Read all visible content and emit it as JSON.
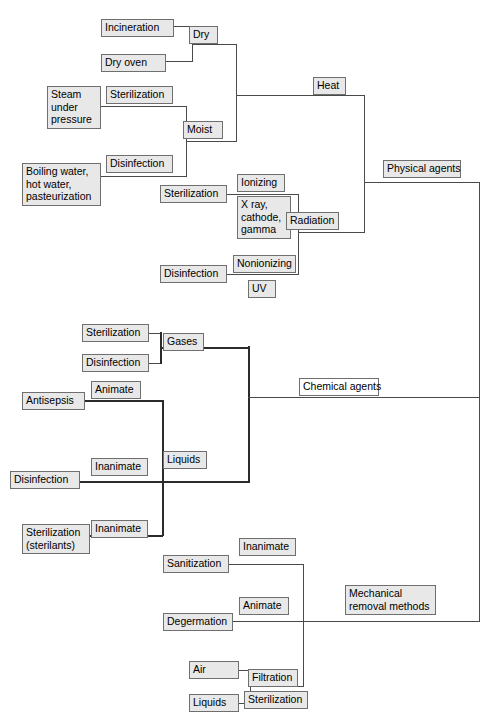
{
  "diagram": {
    "type": "hierarchy-tree",
    "colors": {
      "node_fill": "#e8e8e8",
      "node_fill_plain": "#ffffff",
      "node_border": "#6f6f6f",
      "connector": "#4a4a4a",
      "connector_thick": "#2b2b2b"
    },
    "nodes": {
      "incineration": "Incineration",
      "dry_oven": "Dry oven",
      "dry": "Dry",
      "sterilization_moist": "Sterilization",
      "steam_under_pressure": "Steam\nunder\npressure",
      "moist": "Moist",
      "heat": "Heat",
      "disinfection_moist": "Disinfection",
      "boiling_water": "Boiling water,\nhot water,\npasteurization",
      "sterilization_radiation": "Sterilization",
      "ionizing": "Ionizing",
      "xray_cathode_gamma": "X ray,\ncathode,\ngamma",
      "radiation": "Radiation",
      "disinfection_radiation": "Disinfection",
      "nonionizing": "Nonionizing",
      "uv": "UV",
      "physical_agents": "Physical agents",
      "sterilization_gases": "Sterilization",
      "disinfection_gases": "Disinfection",
      "gases": "Gases",
      "antisepsis": "Antisepsis",
      "animate_antisepsis": "Animate",
      "disinfection_liquids": "Disinfection",
      "inanimate_disinfection": "Inanimate",
      "liquids_chem": "Liquids",
      "sterilization_sterilants": "Sterilization\n(sterilants)",
      "inanimate_sterilants": "Inanimate",
      "chemical_agents": "Chemical agents",
      "sanitization": "Sanitization",
      "inanimate_sanitization": "Inanimate",
      "degermation": "Degermation",
      "animate_degermation": "Animate",
      "mechanical_removal_methods": "Mechanical\nremoval methods",
      "air": "Air",
      "liquids_filtration": "Liquids",
      "filtration": "Filtration",
      "sterilization_filtration": "Sterilization"
    }
  }
}
